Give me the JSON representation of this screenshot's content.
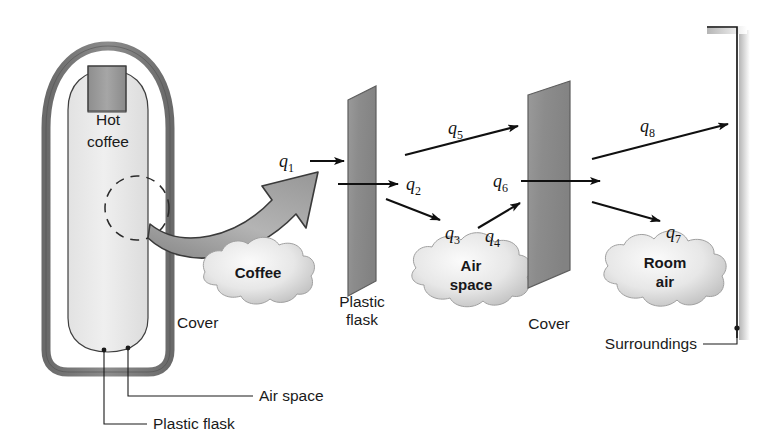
{
  "figure": {
    "kind": "thermos-heat-transfer-diagram",
    "background_color": "#ffffff"
  },
  "thermos": {
    "interior_label": "Hot coffee",
    "callouts": [
      {
        "id": "cover",
        "label": "Cover"
      },
      {
        "id": "air-space",
        "label": "Air space"
      },
      {
        "id": "plastic-flask",
        "label": "Plastic flask"
      }
    ],
    "colors": {
      "shell_outline": "#6f6f6f",
      "shell_fill": "#ffffff",
      "inner_fill": "#ececec",
      "cap_fill": "#9c9c9c"
    }
  },
  "nodes": [
    {
      "id": "coffee",
      "label": "Coffee",
      "label_lines": [
        "Coffee"
      ]
    },
    {
      "id": "air-space",
      "label": "Air space",
      "label_lines": [
        "Air",
        "space"
      ]
    },
    {
      "id": "room-air",
      "label": "Room air",
      "label_lines": [
        "Room",
        "air"
      ]
    }
  ],
  "barriers": [
    {
      "id": "plastic-flask",
      "label": "Plastic flask",
      "label_lines": [
        "Plastic",
        "flask"
      ],
      "fill": "#8f8f8f"
    },
    {
      "id": "cover",
      "label": "Cover",
      "label_lines": [
        "Cover"
      ],
      "fill": "#8f8f8f"
    }
  ],
  "boundary": {
    "id": "surroundings",
    "label": "Surroundings",
    "line_color": "#1a1a1a",
    "shadow_color": "#c9c9c9"
  },
  "heat_flows": [
    {
      "id": "q1",
      "symbol": "q",
      "subscript": "1",
      "label": "q1",
      "from": "coffee",
      "to": "plastic-flask",
      "mode": "convection"
    },
    {
      "id": "q2",
      "symbol": "q",
      "subscript": "2",
      "label": "q2",
      "from": "plastic-flask",
      "to": "air-space",
      "mode": "conduction"
    },
    {
      "id": "q3",
      "symbol": "q",
      "subscript": "3",
      "label": "q3",
      "from": "plastic-flask",
      "to": "air-space",
      "mode": "convection"
    },
    {
      "id": "q4",
      "symbol": "q",
      "subscript": "4",
      "label": "q4",
      "from": "air-space",
      "to": "cover",
      "mode": "convection"
    },
    {
      "id": "q5",
      "symbol": "q",
      "subscript": "5",
      "label": "q5",
      "from": "plastic-flask",
      "to": "cover",
      "mode": "radiation"
    },
    {
      "id": "q6",
      "symbol": "q",
      "subscript": "6",
      "label": "q6",
      "from": "cover",
      "to": "room-air",
      "mode": "conduction"
    },
    {
      "id": "q7",
      "symbol": "q",
      "subscript": "7",
      "label": "q7",
      "from": "cover",
      "to": "room-air",
      "mode": "convection"
    },
    {
      "id": "q8",
      "symbol": "q",
      "subscript": "8",
      "label": "q8",
      "from": "cover",
      "to": "surroundings",
      "mode": "radiation"
    }
  ],
  "magnifier_arrow": {
    "id": "zoom-arrow",
    "from": "thermos-wall-detail",
    "to": "coffee",
    "fill": "#a8a8a8",
    "stroke": "#3c3c3c"
  }
}
